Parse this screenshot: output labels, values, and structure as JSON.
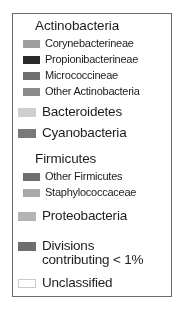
{
  "legend": {
    "title": "Taxonomic composition legend",
    "entries": [
      {
        "id": "actinobacteria",
        "label": "Actinobacteria",
        "kind": "group-header",
        "swatch": null,
        "top": 4
      },
      {
        "id": "corynebacterineae",
        "label": "Corynebacterineae",
        "kind": "sub",
        "swatch": "#9e9e9e",
        "top": 23
      },
      {
        "id": "propionibacterineae",
        "label": "Propionibacterineae",
        "kind": "sub",
        "swatch": "#2b2b2b",
        "top": 39
      },
      {
        "id": "micrococcineae",
        "label": "Micrococcineae",
        "kind": "sub",
        "swatch": "#6e6e6e",
        "top": 55
      },
      {
        "id": "other-actinobacteria",
        "label": "Other Actinobacteria",
        "kind": "sub",
        "swatch": "#8b8b8b",
        "top": 71
      },
      {
        "id": "bacteroidetes",
        "label": "Bacteroidetes",
        "kind": "top",
        "swatch": "#cfcfcf",
        "top": 91
      },
      {
        "id": "cyanobacteria",
        "label": "Cyanobacteria",
        "kind": "top",
        "swatch": "#797979",
        "top": 112
      },
      {
        "id": "firmicutes",
        "label": "Firmicutes",
        "kind": "group-header",
        "swatch": null,
        "top": 137
      },
      {
        "id": "other-firmicutes",
        "label": "Other Firmicutes",
        "kind": "sub",
        "swatch": "#6e6e6e",
        "top": 156
      },
      {
        "id": "staphylococcaceae",
        "label": "Staphylococcaceae",
        "kind": "sub",
        "swatch": "#a8a8a8",
        "top": 172
      },
      {
        "id": "proteobacteria",
        "label": "Proteobacteria",
        "kind": "top",
        "swatch": "#b4b4b4",
        "top": 195
      },
      {
        "id": "divisions-under-1pct",
        "label": "Divisions",
        "label_line2": "contributing < 1%",
        "kind": "top",
        "swatch": "#6e6e6e",
        "top": 225
      },
      {
        "id": "unclassified",
        "label": "Unclassified",
        "kind": "top",
        "swatch": "#ffffff",
        "swatch_style": "outlined",
        "top": 262
      }
    ]
  }
}
